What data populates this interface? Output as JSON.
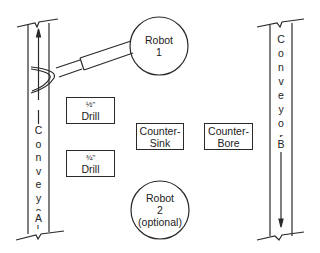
{
  "diagram": {
    "conveyor_a": {
      "letters": [
        "C",
        "o",
        "n",
        "v",
        "e",
        "y",
        "o",
        "r"
      ],
      "id": "A",
      "direction": "up"
    },
    "conveyor_b": {
      "letters": [
        "C",
        "o",
        "n",
        "v",
        "e",
        "y",
        "o",
        "r"
      ],
      "id": "B",
      "direction": "down"
    },
    "robot_1": {
      "line1": "Robot",
      "line2": "1"
    },
    "robot_2": {
      "line1": "Robot",
      "line2": "2",
      "line3": "(optional)"
    },
    "stations": {
      "half_drill": {
        "size": "½\"",
        "label": "Drill"
      },
      "three_quarter_drill": {
        "size": "¾\"",
        "label": "Drill"
      },
      "counter_sink": {
        "line1": "Counter-",
        "line2": "Sink"
      },
      "counter_bore": {
        "line1": "Counter-",
        "line2": "Bore"
      }
    },
    "colors": {
      "line": "#2a2a2a",
      "background": "#ffffff"
    }
  }
}
